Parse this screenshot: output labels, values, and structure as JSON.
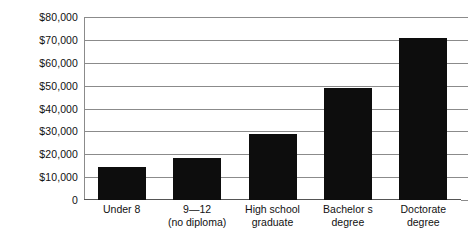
{
  "chart_data": {
    "type": "bar",
    "title": "",
    "subtitle": "",
    "xlabel": "",
    "ylabel": "",
    "categories": [
      "Under 8",
      "9—12\n(no diploma)",
      "High school\ngraduate",
      "Bachelor s\ndegree",
      "Doctorate\ndegree"
    ],
    "category_lines": [
      [
        "Under 8",
        ""
      ],
      [
        "9—12",
        "(no diploma)"
      ],
      [
        "High school",
        "graduate"
      ],
      [
        "Bachelor s",
        "degree"
      ],
      [
        "Doctorate",
        "degree"
      ]
    ],
    "values": [
      14400,
      18300,
      28800,
      49000,
      70700
    ],
    "ylim": [
      0,
      80000
    ],
    "ytick_values": [
      0,
      10000,
      20000,
      30000,
      40000,
      50000,
      60000,
      70000,
      80000
    ],
    "ytick_labels": [
      "0",
      "$10,000",
      "$20,000",
      "$30,000",
      "$40,000",
      "$50,000",
      "$60,000",
      "$70,000",
      "$80,000"
    ],
    "grid": true,
    "legend": null,
    "bar_color": "#0d0d0d",
    "grid_color": "#8b8b8b",
    "axis_color": "#555555",
    "background": "#ffffff"
  }
}
